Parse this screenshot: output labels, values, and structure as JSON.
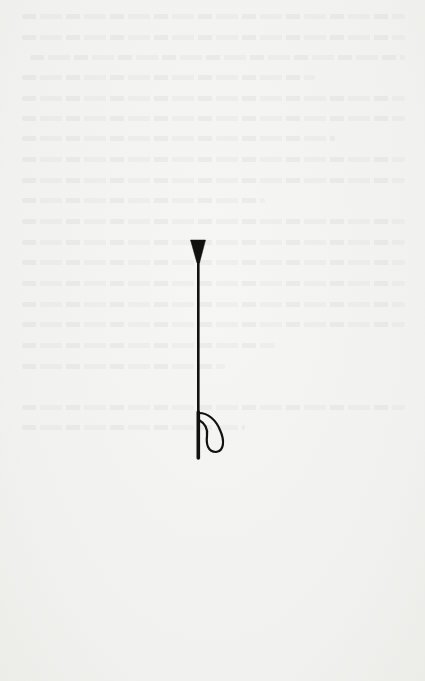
{
  "page": {
    "kind": "book page",
    "background_color": "#f3f3f1",
    "bleed_through_text_legible": false
  },
  "illustration": {
    "subject": "riding crop",
    "ink_color": "#111111",
    "parts": [
      "tip",
      "shaft",
      "handle",
      "wrist-loop"
    ]
  }
}
